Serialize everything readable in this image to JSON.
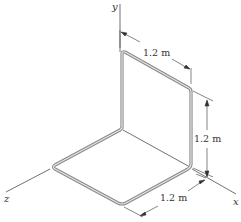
{
  "diagram": {
    "type": "engineering-figure",
    "axes": {
      "x": "x",
      "y": "y",
      "z": "z"
    },
    "dimensions": {
      "top_segment": "1.2 m",
      "vertical_segment": "1.2 m",
      "bottom_segment": "1.2 m"
    },
    "colors": {
      "rod_outer": "#8a8a8a",
      "rod_inner": "#e6e6e6",
      "lines": "#333333",
      "background": "#ffffff"
    }
  }
}
